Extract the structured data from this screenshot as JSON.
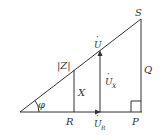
{
  "diagram": {
    "type": "power-impedance-voltage triangle",
    "line_color": "#333333",
    "labels": {
      "S": "S",
      "Q": "Q",
      "P": "P",
      "R": "R",
      "X": "X",
      "Z": "|Z|",
      "phi": "φ",
      "U": "U",
      "UX": "U",
      "UX_sub": "X",
      "UR": "U",
      "UR_sub": "R",
      "dot": "·"
    }
  }
}
